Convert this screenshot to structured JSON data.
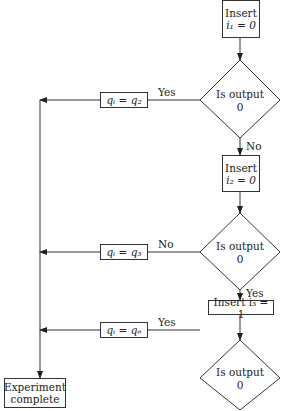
{
  "nodes": {
    "insert1": {
      "line1": "Insert",
      "line2": "i₁ = 0"
    },
    "decision1": {
      "line1": "Is output",
      "line2": "0"
    },
    "insert2": {
      "line1": "Insert",
      "line2": "i₂ = 0"
    },
    "decision2": {
      "line1": "Is output",
      "line2": "0"
    },
    "insert3": {
      "line1": "Insert i₃ = 1"
    },
    "decision3": {
      "line1": "Is output",
      "line2": "0"
    },
    "assign_q2": "qᵢ = q₂",
    "assign_q3": "qᵢ = q₃",
    "assign_q6": "qᵢ = q₆",
    "assign_q5": "qᵢ = q₅",
    "complete": {
      "line1": "Experiment",
      "line2": "complete"
    }
  },
  "edges": {
    "d1_yes": "Yes",
    "d1_no": "No",
    "d2_no": "No",
    "d2_yes": "Yes",
    "d3_yes": "Yes",
    "d3_no": "No"
  }
}
